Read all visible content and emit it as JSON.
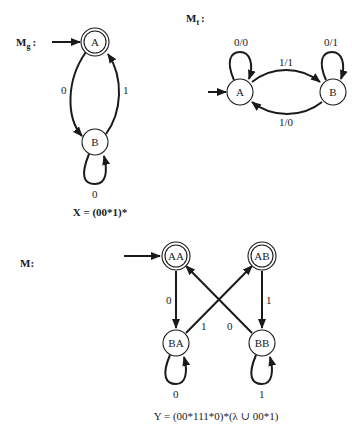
{
  "machines": {
    "mg": {
      "name": "M",
      "subscript": "g",
      "suffix": ":",
      "states": [
        {
          "id": "A",
          "label": "A",
          "start": true,
          "accepting": true
        },
        {
          "id": "B",
          "label": "B",
          "start": false,
          "accepting": false
        }
      ],
      "transitions": [
        {
          "from": "A",
          "to": "B",
          "label": "0"
        },
        {
          "from": "B",
          "to": "A",
          "label": "1"
        },
        {
          "from": "B",
          "to": "B",
          "label": "0"
        }
      ],
      "caption": "X = (00*1)*"
    },
    "mt": {
      "name": "M",
      "subscript": "t",
      "suffix": ":",
      "states": [
        {
          "id": "A",
          "label": "A",
          "start": true,
          "accepting": false
        },
        {
          "id": "B",
          "label": "B",
          "start": false,
          "accepting": false
        }
      ],
      "transitions": [
        {
          "from": "A",
          "to": "A",
          "label": "0/0"
        },
        {
          "from": "A",
          "to": "B",
          "label": "1/1"
        },
        {
          "from": "B",
          "to": "A",
          "label": "1/0"
        },
        {
          "from": "B",
          "to": "B",
          "label": "0/1"
        }
      ]
    },
    "m": {
      "name": "M:",
      "states": [
        {
          "id": "AA",
          "label": "AA",
          "start": true,
          "accepting": true
        },
        {
          "id": "AB",
          "label": "AB",
          "start": false,
          "accepting": true
        },
        {
          "id": "BA",
          "label": "BA",
          "start": false,
          "accepting": false
        },
        {
          "id": "BB",
          "label": "BB",
          "start": false,
          "accepting": false
        }
      ],
      "transitions": [
        {
          "from": "AA",
          "to": "BA",
          "label": "0"
        },
        {
          "from": "AB",
          "to": "BB",
          "label": "1"
        },
        {
          "from": "BA",
          "to": "AB",
          "label": "1"
        },
        {
          "from": "BB",
          "to": "AA",
          "label": "0"
        },
        {
          "from": "BA",
          "to": "BA",
          "label": "0"
        },
        {
          "from": "BB",
          "to": "BB",
          "label": "1"
        }
      ],
      "caption": "Y = (00*111*0)*(λ ∪ 00*1)"
    }
  }
}
